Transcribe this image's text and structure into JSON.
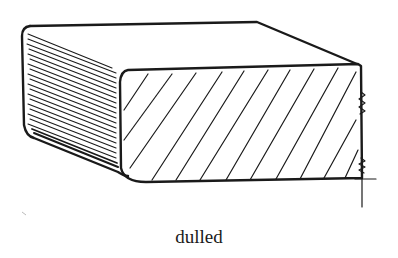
{
  "figure": {
    "caption": "dulled",
    "ink_color": "#1a1a1a",
    "background": "#ffffff"
  }
}
